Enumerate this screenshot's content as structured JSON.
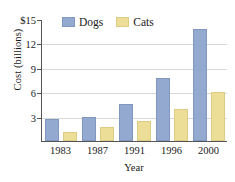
{
  "chart_data": {
    "type": "bar",
    "title": "",
    "xlabel": "Year",
    "ylabel": "Cost (billions)",
    "categories": [
      "1983",
      "1987",
      "1991",
      "1996",
      "2000"
    ],
    "series": [
      {
        "name": "Dogs",
        "color": "#93a9d0",
        "values": [
          2.7,
          3.0,
          4.5,
          7.7,
          13.8
        ]
      },
      {
        "name": "Cats",
        "color": "#ecdd97",
        "values": [
          1.1,
          1.7,
          2.4,
          3.9,
          6.0
        ]
      }
    ],
    "ylim": [
      0,
      15
    ],
    "yticks": [
      3,
      6,
      9,
      12,
      15
    ],
    "ytick_labels": [
      "3",
      "6",
      "9",
      "12",
      "$15"
    ],
    "grid": true,
    "legend_position": "top-center"
  },
  "axes": {
    "y_title": "Cost (billions)",
    "x_title": "Year"
  },
  "legend": {
    "entries": [
      {
        "label": "Dogs",
        "swatch": "dogs-swatch-icon"
      },
      {
        "label": "Cats",
        "swatch": "cats-swatch-icon"
      }
    ]
  }
}
